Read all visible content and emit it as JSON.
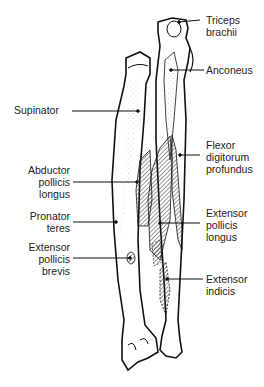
{
  "diagram": {
    "colors": {
      "line": "#111111",
      "hatch": "#444444",
      "bone_fill": "#ffffff",
      "stipple": "#bbbbbb"
    },
    "labels": {
      "triceps": {
        "l1": "Triceps",
        "l2": "brachii"
      },
      "anconeus": {
        "l1": "Anconeus"
      },
      "supinator": {
        "l1": "Supinator"
      },
      "flexor": {
        "l1": "Flexor",
        "l2": "digitorum",
        "l3": "profundus"
      },
      "abductor": {
        "l1": "Abductor",
        "l2": "pollicis",
        "l3": "longus"
      },
      "pronator": {
        "l1": "Pronator",
        "l2": "teres"
      },
      "epl": {
        "l1": "Extensor",
        "l2": "pollicis",
        "l3": "longus"
      },
      "epb": {
        "l1": "Extensor",
        "l2": "pollicis",
        "l3": "brevis"
      },
      "indicis": {
        "l1": "Extensor",
        "l2": "indicis"
      }
    }
  }
}
